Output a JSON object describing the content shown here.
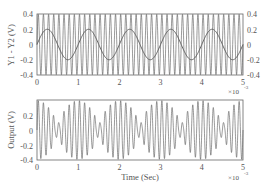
{
  "chart_data": [
    {
      "type": "line",
      "title": "",
      "xlabel": "",
      "ylabel": "Y1 - Y2 (V)",
      "xlim": [
        0,
        5
      ],
      "ylim": [
        -0.4,
        0.4
      ],
      "x_multiplier": "×10⁻³",
      "x_ticks": [
        "0",
        "1",
        "2",
        "3",
        "4",
        "5"
      ],
      "y_ticks_left": [
        "0.4",
        "0.2",
        "0",
        "-0.2",
        "-0.4"
      ],
      "y_ticks_right": [
        "0.4",
        "0.2",
        "0",
        "-0.2",
        "-0.4"
      ],
      "grid": false,
      "legend": null,
      "series": [
        {
          "name": "carrier",
          "description": "high-frequency oscillation filling ±0.4 V",
          "amplitude": 0.4,
          "cycles_per_ms": 8,
          "color": "#555555"
        },
        {
          "name": "modulating sine",
          "description": "sine wave ~0.2 V amplitude, 1 ms period",
          "amplitude": 0.2,
          "cycles_per_ms": 1,
          "phase_deg": 0,
          "color": "#555555",
          "x": [
            0,
            0.25,
            0.5,
            0.75,
            1.0,
            1.25,
            1.5,
            1.75,
            2.0,
            2.25,
            2.5,
            2.75,
            3.0,
            3.25,
            3.5,
            3.75,
            4.0,
            4.25,
            4.5,
            4.75,
            5.0
          ],
          "values": [
            0,
            0.2,
            0,
            -0.2,
            0,
            0.2,
            0,
            -0.2,
            0,
            0.2,
            0,
            -0.2,
            0,
            0.2,
            0,
            -0.2,
            0,
            0.2,
            0,
            -0.2,
            0
          ]
        }
      ]
    },
    {
      "type": "line",
      "title": "",
      "xlabel": "Time (Sec)",
      "ylabel": "Output (V)",
      "xlim": [
        0,
        5
      ],
      "ylim": [
        -0.4,
        0.4
      ],
      "x_multiplier": "×10⁻³",
      "x_ticks": [
        "0",
        "1",
        "2",
        "3",
        "4",
        "5"
      ],
      "y_ticks_left": [
        "0.2",
        "0",
        "-0.2",
        "-0.4"
      ],
      "grid": false,
      "legend": null,
      "series": [
        {
          "name": "output",
          "description": "beat-like waveform with bursts reaching ±0.4 V and small W/M-shaped segments near 0 V repeating every ~1 ms",
          "peak": 0.4,
          "carrier_cycles_per_ms": 8,
          "envelope_period_ms": 1,
          "color": "#555555"
        }
      ]
    }
  ],
  "plots": {
    "top": {
      "ylabel": "Y1 - Y2 (V)",
      "x_ticks": [
        "0",
        "1",
        "2",
        "3",
        "4",
        "5"
      ],
      "y_ticks": [
        "0.4",
        "0.2",
        "0",
        "-0.2",
        "-0.4"
      ],
      "x_multiplier": "×10",
      "x_exponent": "-3"
    },
    "bottom": {
      "ylabel": "Output (V)",
      "xlabel": "Time (Sec)",
      "x_ticks": [
        "0",
        "1",
        "2",
        "3",
        "4",
        "5"
      ],
      "y_ticks": [
        "0.2",
        "0",
        "-0.2",
        "-0.4"
      ],
      "x_multiplier": "×10",
      "x_exponent": "-3"
    }
  },
  "colors": {
    "line": "#555555",
    "axis": "#666666",
    "text": "#555555"
  }
}
